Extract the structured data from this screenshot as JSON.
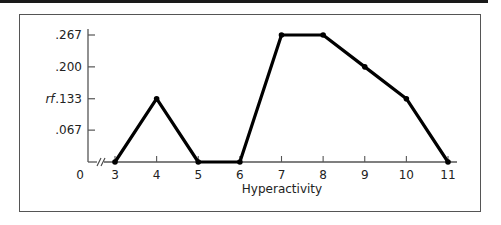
{
  "chart_data": {
    "type": "line",
    "title": "",
    "xlabel": "Hyperactivity",
    "ylabel": "rf",
    "x": [
      3,
      4,
      5,
      6,
      7,
      8,
      9,
      10,
      11
    ],
    "categories": [
      "3",
      "4",
      "5",
      "6",
      "7",
      "8",
      "9",
      "10",
      "11"
    ],
    "values": [
      0,
      0.133,
      0,
      0,
      0.267,
      0.267,
      0.2,
      0.133,
      0
    ],
    "series": [
      {
        "name": "rf",
        "values": [
          0,
          0.133,
          0,
          0,
          0.267,
          0.267,
          0.2,
          0.133,
          0
        ]
      }
    ],
    "yticks": [
      0,
      0.067,
      0.133,
      0.2,
      0.267
    ],
    "ytick_labels": [
      "0",
      ".067",
      ".133",
      ".200",
      ".267"
    ],
    "xticks": [
      3,
      4,
      5,
      6,
      7,
      8,
      9,
      10,
      11
    ],
    "ylim": [
      0,
      0.267
    ],
    "xlim": [
      3,
      11
    ],
    "axis_break": "x-axis break mark (//) between 0 and 3",
    "grid": false,
    "legend": "none",
    "line_color": "#000000"
  }
}
